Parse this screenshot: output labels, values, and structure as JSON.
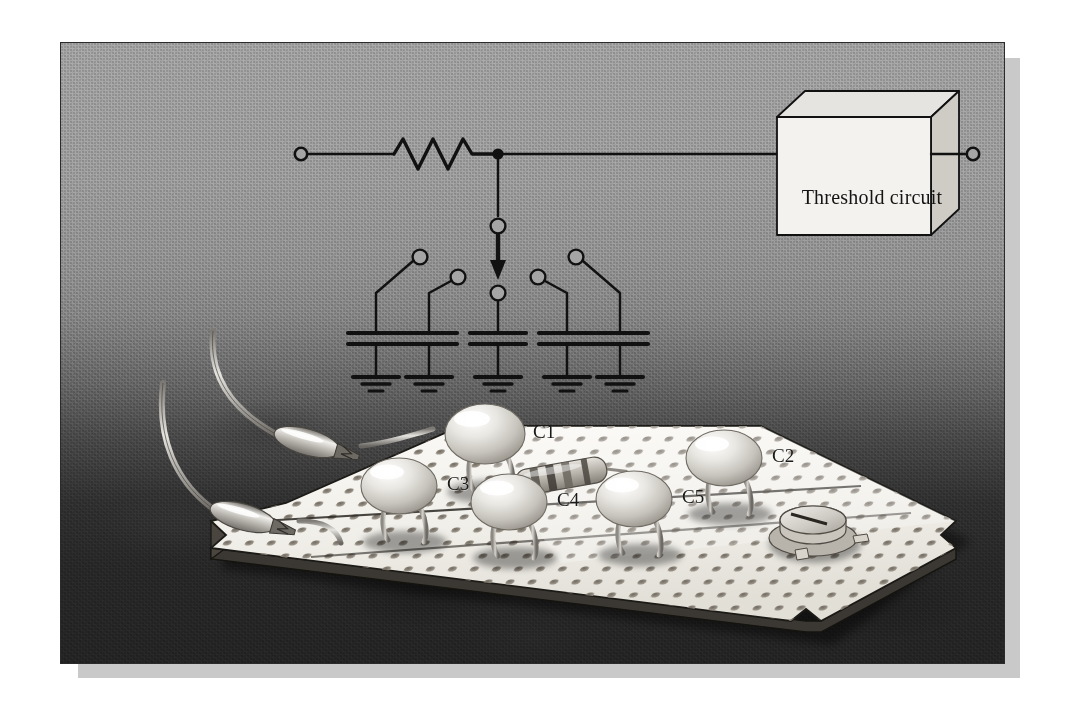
{
  "figure": {
    "domain": "technical-illustration",
    "panel": {
      "background_top_color": "#a9a9a9",
      "background_bottom_color": "#262626",
      "border_color": "#2b2b2b",
      "shadow_color": "#c9c9c9"
    }
  },
  "schematic": {
    "ink_color": "#111111",
    "left_terminal": {
      "name": "input-terminal",
      "shape": "open-circle"
    },
    "right_terminal": {
      "name": "output-terminal",
      "shape": "open-circle"
    },
    "resistor": {
      "name": "series-resistor",
      "symbol": "zigzag",
      "peaks": 3
    },
    "junction_dot": {
      "name": "node-junction",
      "shape": "filled-circle"
    },
    "rotary_switch": {
      "name": "rotary-selector-switch",
      "wiper": "arrow",
      "pole_contacts": 2,
      "side_contacts": 4,
      "total_positions": 5
    },
    "capacitors": [
      {
        "id": "C1",
        "symbol": "parallel-plate",
        "ground": "earth-3-bar"
      },
      {
        "id": "C2",
        "symbol": "parallel-plate",
        "ground": "earth-3-bar"
      },
      {
        "id": "C3",
        "symbol": "parallel-plate",
        "ground": "earth-3-bar"
      },
      {
        "id": "C4",
        "symbol": "parallel-plate",
        "ground": "earth-3-bar"
      },
      {
        "id": "C5",
        "symbol": "parallel-plate",
        "ground": "earth-3-bar"
      }
    ],
    "threshold_box": {
      "label": "Threshold circuit",
      "style": "isometric-3d-box",
      "face_color": "#f2f0ec",
      "top_color": "#e4e2de",
      "side_color": "#cfcdc9"
    }
  },
  "breadboard": {
    "name": "perfboard",
    "surface_color": "#f4f2ee",
    "hole_color": "#8a8378",
    "components": [
      {
        "type": "ceramic-capacitor",
        "label": "C1"
      },
      {
        "type": "ceramic-capacitor",
        "label": "C2"
      },
      {
        "type": "ceramic-capacitor",
        "label": "C3"
      },
      {
        "type": "ceramic-capacitor",
        "label": "C4"
      },
      {
        "type": "ceramic-capacitor",
        "label": "C5"
      },
      {
        "type": "axial-resistor",
        "label": ""
      },
      {
        "type": "trimmer-potentiometer",
        "label": ""
      }
    ],
    "leads": [
      {
        "type": "alligator-clip",
        "position": "upper-left"
      },
      {
        "type": "alligator-clip",
        "position": "lower-left"
      }
    ]
  }
}
